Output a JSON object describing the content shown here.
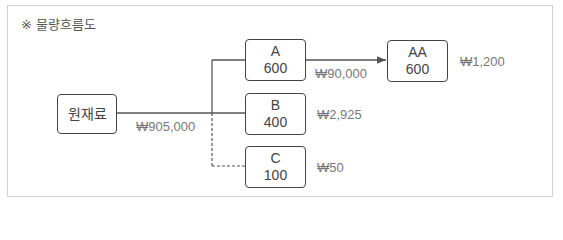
{
  "diagram": {
    "title": "※ 물량흐름도",
    "nodes": [
      {
        "id": "raw",
        "label": "원재료",
        "qty": ""
      },
      {
        "id": "A",
        "label": "A",
        "qty": "600"
      },
      {
        "id": "B",
        "label": "B",
        "qty": "400"
      },
      {
        "id": "C",
        "label": "C",
        "qty": "100"
      },
      {
        "id": "AA",
        "label": "AA",
        "qty": "600"
      }
    ],
    "edges": [
      {
        "from": "raw",
        "to": "A",
        "style": "solid"
      },
      {
        "from": "raw",
        "to": "B",
        "style": "solid"
      },
      {
        "from": "raw",
        "to": "C",
        "style": "dashed"
      },
      {
        "from": "A",
        "to": "AA",
        "style": "solid-arrow"
      }
    ],
    "values": {
      "raw_cost": "₩905,000",
      "A_to_AA": "₩90,000",
      "B_value": "₩2,925",
      "C_value": "₩50",
      "AA_value": "₩1,200"
    },
    "colors": {
      "line": "#555555",
      "box_border": "#444444",
      "value_text": "#777777",
      "frame": "#cfcfcf"
    }
  }
}
